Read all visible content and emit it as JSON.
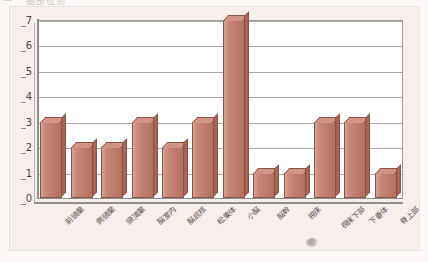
{
  "figure": {
    "title_fragment": "脳部位別",
    "background_color": "#f8efec",
    "plot_background_color": "#ffffff",
    "bar_color": "#c8897a",
    "bar_top_color": "#cf9486",
    "bar_side_color": "#a96354",
    "bar_border_color": "#8a5548",
    "grid_color": "#a9a9a9",
    "axis_color": "#8e8e8e"
  },
  "chart_data": {
    "type": "bar",
    "title": "脳部位別",
    "xlabel": "",
    "ylabel": "",
    "ylim": [
      0,
      7
    ],
    "yticks": [
      0,
      1,
      2,
      3,
      4,
      5,
      6,
      7
    ],
    "ytick_labels": [
      "0",
      "1",
      "2",
      "3",
      "4",
      "5",
      "6",
      "7"
    ],
    "grid": true,
    "grid_axis": "y",
    "legend": false,
    "legend_position": "none",
    "style": "3d-column",
    "categories": [
      "前頭葉",
      "側頭葉",
      "頭頂葉",
      "脳室内",
      "脳底核",
      "松果体",
      "小脳",
      "脳幹",
      "視床",
      "視床下部",
      "下垂体",
      "脊上部"
    ],
    "values": [
      3,
      2,
      2,
      3,
      2,
      3,
      7,
      1,
      1,
      3,
      3,
      1
    ],
    "series": [
      {
        "name": "症例数",
        "values": [
          3,
          2,
          2,
          3,
          2,
          3,
          7,
          1,
          1,
          3,
          3,
          1
        ]
      }
    ]
  }
}
